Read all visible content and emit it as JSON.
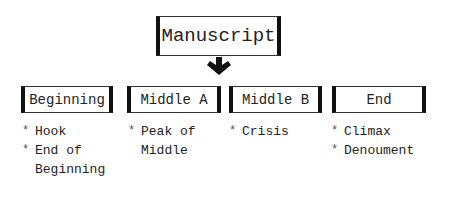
{
  "diagram": {
    "root": {
      "label": "Manuscript"
    },
    "sections": [
      {
        "label": "Beginning",
        "items": [
          "Hook",
          "End of Beginning"
        ]
      },
      {
        "label": "Middle A",
        "items": [
          "Peak of Middle"
        ]
      },
      {
        "label": "Middle B",
        "items": [
          "Crisis"
        ]
      },
      {
        "label": "End",
        "items": [
          "Climax",
          "Denoument"
        ]
      }
    ]
  }
}
